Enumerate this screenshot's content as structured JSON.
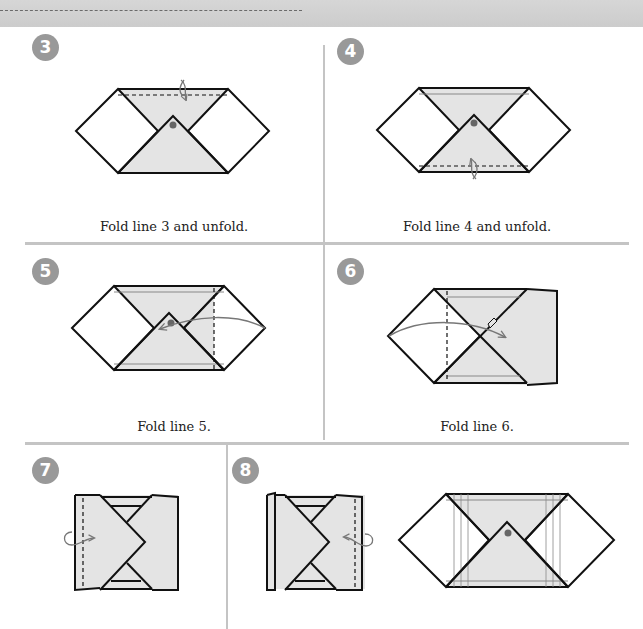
{
  "page": {
    "type": "origami instruction diagram",
    "colors": {
      "paper_fill": "#e4e4e4",
      "outline": "#111111",
      "badge": "#999999",
      "divider": "#c4c4c4",
      "arrow": "#777777",
      "dot": "#666666"
    }
  },
  "steps": [
    {
      "number": "3",
      "caption": "Fold line 3 and unfold.",
      "fold_line": "horizontal dashed near top edge",
      "arrow": "valley fold and unfold"
    },
    {
      "number": "4",
      "caption": "Fold line 4 and unfold.",
      "fold_line": "horizontal dashed near bottom edge",
      "arrow": "valley fold and unfold"
    },
    {
      "number": "5",
      "caption": "Fold line 5.",
      "fold_line": "vertical dashed on right side",
      "arrow": "fold right point to the left"
    },
    {
      "number": "6",
      "caption": "Fold line 6.",
      "fold_line": "vertical dashed on left side",
      "arrow": "fold left point to the right"
    },
    {
      "number": "7",
      "caption": "",
      "fold_line": "vertical dashed near left edge",
      "arrow": "fold over to the right"
    },
    {
      "number": "8",
      "caption": "",
      "fold_line": "vertical dashed near right edge",
      "arrow": "fold over to the left, then unfold to flat result"
    }
  ]
}
